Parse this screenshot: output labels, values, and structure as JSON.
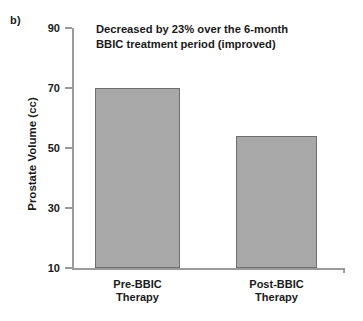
{
  "panel": {
    "label": "b)"
  },
  "annotation": {
    "line1": "Decreased by 23% over the 6-month",
    "line2": "BBIC treatment period (improved)"
  },
  "colors": {
    "bar_fill": "#a8a8a8",
    "bar_border": "#6e6e6e",
    "axis": "#9a9a9a",
    "text": "#1a1a1a",
    "background": "#ffffff"
  },
  "chart_data": {
    "type": "bar",
    "title": "",
    "subtitle": "",
    "xlabel": "",
    "ylabel": "Prostate Volume (cc)",
    "categories": [
      "Pre-BBIC Therapy",
      "Post-BBIC Therapy"
    ],
    "category_lines": [
      [
        "Pre-BBIC",
        "Therapy"
      ],
      [
        "Post-BBIC",
        "Therapy"
      ]
    ],
    "values": [
      70,
      54
    ],
    "ylim": [
      10,
      90
    ],
    "yticks": [
      90,
      70,
      50,
      30,
      10
    ],
    "ytick_labels": [
      "90",
      "70",
      "50",
      "30",
      "10"
    ],
    "grid": false,
    "legend": false,
    "annotations": [
      "Decreased by 23% over the 6-month",
      "BBIC treatment period (improved)"
    ]
  }
}
